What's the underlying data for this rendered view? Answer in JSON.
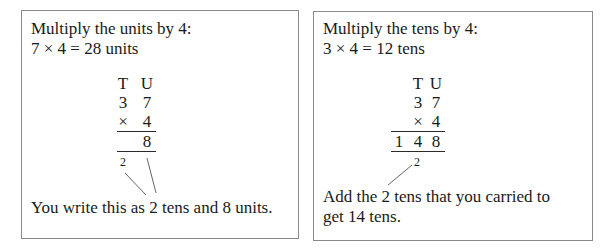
{
  "left_panel": {
    "heading": "Multiply the units by 4:",
    "equation": "7 × 4 = 28 units",
    "column_headers": [
      "T",
      "U"
    ],
    "row1": [
      "",
      "3",
      "7"
    ],
    "row2": [
      "",
      "×",
      "4"
    ],
    "result": [
      "",
      "",
      "8"
    ],
    "carry": "2",
    "caption": "You write this as 2 tens and 8 units."
  },
  "right_panel": {
    "heading": "Multiply the tens by 4:",
    "equation": "3 × 4 = 12 tens",
    "column_headers": [
      "T",
      "U"
    ],
    "row1": [
      "",
      "3",
      "7"
    ],
    "row2": [
      "",
      "×",
      "4"
    ],
    "result": [
      "1",
      "4",
      "8"
    ],
    "carry": "2",
    "caption_line1": "Add the 2 tens that you carried to",
    "caption_line2": "get 14 tens."
  }
}
